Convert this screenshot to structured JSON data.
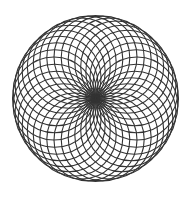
{
  "diagram": {
    "type": "rotated-circle-rosette",
    "center": [
      95.5,
      98.5
    ],
    "outer_radius": 83,
    "circle_count": 36,
    "circle_radius": 41.5,
    "stroke_color": "#333333",
    "stroke_width": 1.1,
    "background": "#ffffff"
  }
}
